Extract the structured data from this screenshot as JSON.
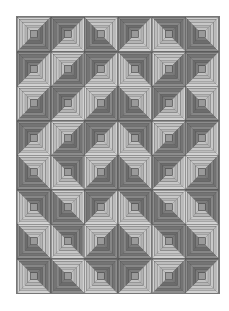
{
  "quilt": {
    "title": "Log cabin quilt pattern",
    "columns": 6,
    "rows": 8,
    "rings": 5,
    "colors": {
      "light": [
        "#d2d2d2",
        "#bdbdbd",
        "#c8c8c8",
        "#b4b4b4",
        "#c2c2c2"
      ],
      "dark": [
        "#8c8c8c",
        "#747474",
        "#868686",
        "#6c6c6c",
        "#7c7c7c"
      ],
      "center": "#9a9a9a",
      "line": "#4a4a4a"
    },
    "layout": [
      [
        "TL",
        "BR",
        "TR",
        "BR",
        "BL",
        "TR"
      ],
      [
        "BR",
        "TL",
        "BR",
        "BL",
        "TL",
        "BR"
      ],
      [
        "TL",
        "BR",
        "TL",
        "TR",
        "BR",
        "TR"
      ],
      [
        "BR",
        "TL",
        "BR",
        "BL",
        "TL",
        "BR"
      ],
      [
        "TR",
        "BL",
        "TL",
        "TR",
        "BR",
        "TL"
      ],
      [
        "BL",
        "TR",
        "BR",
        "BL",
        "TR",
        "BL"
      ],
      [
        "TR",
        "BL",
        "TL",
        "TR",
        "BL",
        "TR"
      ],
      [
        "BL",
        "TR",
        "BL",
        "BR",
        "TL",
        "BR"
      ]
    ]
  }
}
